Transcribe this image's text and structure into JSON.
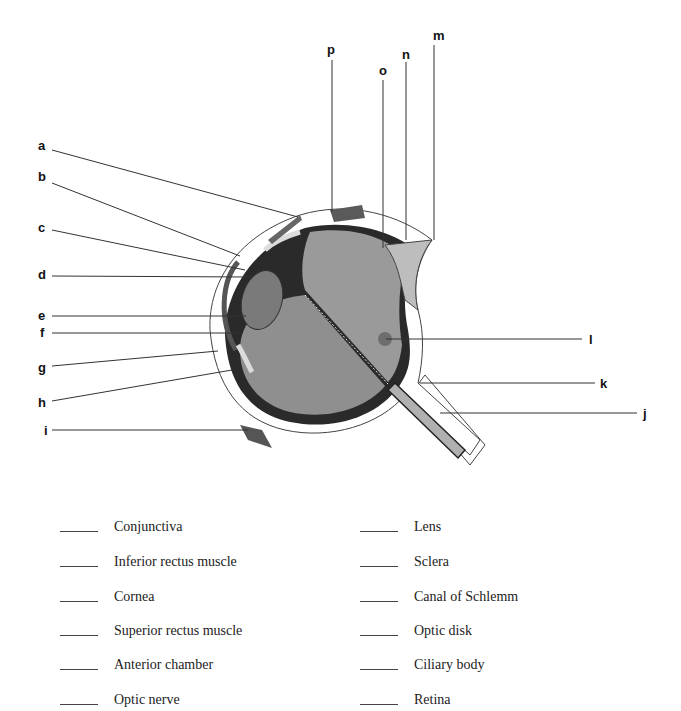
{
  "diagram": {
    "labels": {
      "a": "a",
      "b": "b",
      "c": "c",
      "d": "d",
      "e": "e",
      "f": "f",
      "g": "g",
      "h": "h",
      "i": "i",
      "j": "j",
      "k": "k",
      "l": "l",
      "m": "m",
      "n": "n",
      "o": "o",
      "p": "p"
    },
    "colors": {
      "vitreous": "#9a9a9a",
      "sclera_dark": "#2a2a2a",
      "fovea": "#6e6e6e",
      "line": "#333333"
    }
  },
  "terms": {
    "left": [
      {
        "blank": "_____",
        "label": "Conjunctiva"
      },
      {
        "blank": "_____",
        "label": "Inferior rectus muscle"
      },
      {
        "blank": "_____",
        "label": "Cornea"
      },
      {
        "blank": "_____",
        "label": "Superior rectus muscle"
      },
      {
        "blank": "_____",
        "label": "Anterior chamber"
      },
      {
        "blank": "_____",
        "label": "Optic nerve"
      }
    ],
    "right": [
      {
        "blank": "_____",
        "label": "Lens"
      },
      {
        "blank": "_____",
        "label": "Sclera"
      },
      {
        "blank": "_____",
        "label": "Canal of Schlemm"
      },
      {
        "blank": "_____",
        "label": "Optic disk"
      },
      {
        "blank": "_____",
        "label": "Ciliary body"
      },
      {
        "blank": "_____",
        "label": "Retina"
      }
    ]
  }
}
